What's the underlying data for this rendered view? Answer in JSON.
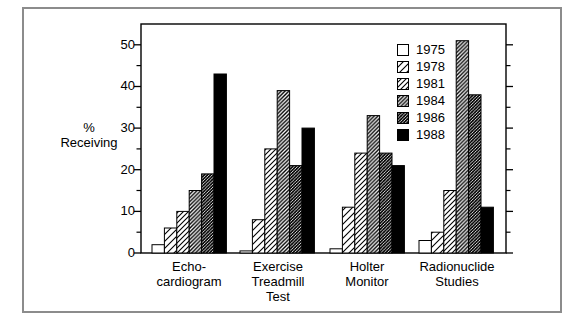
{
  "chart_data": {
    "type": "bar",
    "title": "",
    "ylabel": "% Receiving",
    "ylabel_lines": [
      "%",
      "Receiving"
    ],
    "categories": [
      "Echo-\ncardiogram",
      "Exercise\nTreadmill\nTest",
      "Holter\nMonitor",
      "Radionuclide\nStudies"
    ],
    "series": [
      {
        "name": "1975",
        "pattern": "white",
        "values": [
          2,
          0.5,
          1,
          3
        ]
      },
      {
        "name": "1978",
        "pattern": "hatch-light",
        "values": [
          6,
          8,
          11,
          5
        ]
      },
      {
        "name": "1981",
        "pattern": "hatch-medium",
        "values": [
          10,
          25,
          24,
          15
        ]
      },
      {
        "name": "1984",
        "pattern": "hatch-heavy",
        "values": [
          15,
          39,
          33,
          51
        ]
      },
      {
        "name": "1986",
        "pattern": "hatch-dark",
        "values": [
          19,
          21,
          24,
          38
        ]
      },
      {
        "name": "1988",
        "pattern": "black",
        "values": [
          43,
          30,
          21,
          11
        ]
      }
    ],
    "ylim": [
      0,
      55
    ],
    "yticks": [
      0,
      10,
      20,
      30,
      40,
      50
    ],
    "minor_yticks": [
      5,
      15,
      25,
      35,
      45
    ],
    "grid": false,
    "legend_position": "upper-right-inside"
  },
  "colors": {
    "ink": "#000000",
    "background": "#ffffff",
    "frame_border": "#8c8c8c"
  }
}
